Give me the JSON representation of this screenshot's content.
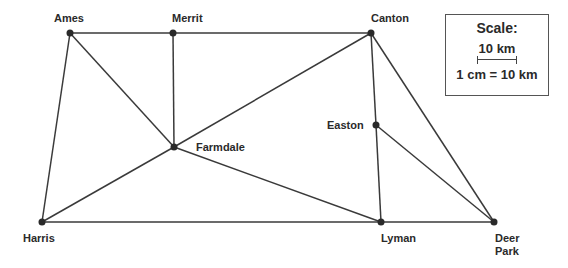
{
  "map": {
    "nodes": [
      {
        "id": "ames",
        "label": "Ames",
        "x": 70,
        "y": 33,
        "lx": 54,
        "ly": 22
      },
      {
        "id": "merrit",
        "label": "Merrit",
        "x": 173,
        "y": 33,
        "lx": 172,
        "ly": 22
      },
      {
        "id": "canton",
        "label": "Canton",
        "x": 371,
        "y": 33,
        "lx": 371,
        "ly": 22
      },
      {
        "id": "farmdale",
        "label": "Farmdale",
        "x": 174,
        "y": 147,
        "lx": 196,
        "ly": 151
      },
      {
        "id": "easton",
        "label": "Easton",
        "x": 376,
        "y": 125,
        "lx": 327,
        "ly": 129
      },
      {
        "id": "harris",
        "label": "Harris",
        "x": 42,
        "y": 222,
        "lx": 23,
        "ly": 242
      },
      {
        "id": "lyman",
        "label": "Lyman",
        "x": 381,
        "y": 222,
        "lx": 381,
        "ly": 242
      },
      {
        "id": "deerpark",
        "label": "Deer",
        "label2": "Park",
        "x": 494,
        "y": 222,
        "lx": 495,
        "ly": 242
      }
    ],
    "edges": [
      [
        "ames",
        "merrit"
      ],
      [
        "merrit",
        "canton"
      ],
      [
        "ames",
        "harris"
      ],
      [
        "ames",
        "farmdale"
      ],
      [
        "merrit",
        "farmdale"
      ],
      [
        "canton",
        "farmdale"
      ],
      [
        "harris",
        "farmdale"
      ],
      [
        "farmdale",
        "lyman"
      ],
      [
        "harris",
        "lyman"
      ],
      [
        "lyman",
        "deerpark"
      ],
      [
        "canton",
        "easton"
      ],
      [
        "easton",
        "lyman"
      ],
      [
        "easton",
        "deerpark"
      ],
      [
        "canton",
        "deerpark"
      ]
    ]
  },
  "scale": {
    "title": "Scale:",
    "distance": "10 km",
    "ratio": "1 cm = 10 km"
  }
}
